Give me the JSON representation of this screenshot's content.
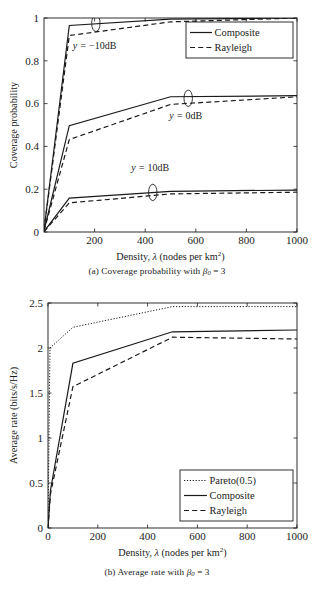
{
  "document": {
    "type": "figure-pair",
    "background_color": "#ffffff",
    "ink_color": "#1a1a1a"
  },
  "figures": [
    {
      "id": "a",
      "caption_prefix": "(a)",
      "caption_text": "Coverage probability with",
      "caption_symbol": "β",
      "caption_subscript": "0",
      "caption_equals": "= 3"
    },
    {
      "id": "b",
      "caption_prefix": "(b)",
      "caption_text": "Average rate with",
      "caption_symbol": "β",
      "caption_subscript": "0",
      "caption_equals": "= 3"
    }
  ],
  "chart_data": [
    {
      "type": "line",
      "id": "coverage-probability",
      "title": "",
      "xlabel": "Density, λ (nodes per km2)",
      "xlabel_parts": {
        "lead": "Density, ",
        "lambda": "λ",
        "rest": " (nodes per km",
        "exponent": "2",
        "close": ")"
      },
      "ylabel": "Coverage probability",
      "xlim": [
        0,
        1000
      ],
      "ylim": [
        0,
        1
      ],
      "xticks": [
        200,
        400,
        600,
        800,
        1000
      ],
      "xtick_labels": [
        "200",
        "400",
        "600",
        "800",
        "1000"
      ],
      "yticks": [
        0,
        0.2,
        0.4,
        0.6,
        0.8,
        1
      ],
      "ytick_labels": [
        "0",
        "0.2",
        "0.4",
        "0.6",
        "0.8",
        "1"
      ],
      "grid": false,
      "legend_position": "top-right",
      "legend": [
        "Composite",
        "Rayleigh"
      ],
      "annotations": [
        {
          "text_lead": "y = ",
          "text_value": "−10dB",
          "x": 200,
          "y": 0.855
        },
        {
          "text_lead": "y = ",
          "text_value": "0dB",
          "x": 560,
          "y": 0.53
        },
        {
          "text_lead": "y = ",
          "text_value": "10dB",
          "x": 420,
          "y": 0.285
        }
      ],
      "marker_ellipses": [
        {
          "x": 205,
          "y": 0.975
        },
        {
          "x": 570,
          "y": 0.625
        },
        {
          "x": 430,
          "y": 0.185
        }
      ],
      "groups": [
        {
          "name": "y = -10dB",
          "series": [
            {
              "name": "Composite",
              "style": "solid",
              "x": [
                0,
                100,
                500,
                1000
              ],
              "values": [
                0.01,
                0.965,
                0.995,
                1.0
              ]
            },
            {
              "name": "Rayleigh",
              "style": "dashed",
              "x": [
                0,
                100,
                500,
                1000
              ],
              "values": [
                0.01,
                0.918,
                0.982,
                1.0
              ]
            }
          ]
        },
        {
          "name": "y = 0dB",
          "series": [
            {
              "name": "Composite",
              "style": "solid",
              "x": [
                0,
                100,
                500,
                1000
              ],
              "values": [
                0.005,
                0.497,
                0.632,
                0.637
              ]
            },
            {
              "name": "Rayleigh",
              "style": "dashed",
              "x": [
                0,
                100,
                500,
                1000
              ],
              "values": [
                0.005,
                0.432,
                0.596,
                0.632
              ]
            }
          ]
        },
        {
          "name": "y = 10dB",
          "series": [
            {
              "name": "Composite",
              "style": "solid",
              "x": [
                0,
                100,
                500,
                1000
              ],
              "values": [
                0.002,
                0.158,
                0.19,
                0.196
              ]
            },
            {
              "name": "Rayleigh",
              "style": "dashed",
              "x": [
                0,
                100,
                500,
                1000
              ],
              "values": [
                0.002,
                0.136,
                0.178,
                0.186
              ]
            }
          ]
        }
      ]
    },
    {
      "type": "line",
      "id": "average-rate",
      "title": "",
      "xlabel": "Density, λ (nodes per km2)",
      "xlabel_parts": {
        "lead": "Density, ",
        "lambda": "λ",
        "rest": " (nodes per km",
        "exponent": "2",
        "close": ")"
      },
      "ylabel": "Average rate (bits/s/Hz)",
      "xlim": [
        0,
        1000
      ],
      "ylim": [
        0,
        2.5
      ],
      "xticks": [
        0,
        200,
        400,
        600,
        800,
        1000
      ],
      "xtick_labels": [
        "0",
        "200",
        "400",
        "600",
        "800",
        "1000"
      ],
      "yticks": [
        0,
        0.5,
        1,
        1.5,
        2,
        2.5
      ],
      "ytick_labels": [
        "0",
        "0.5",
        "1",
        "1.5",
        "2",
        "2.5"
      ],
      "grid": false,
      "legend_position": "bottom-right",
      "legend": [
        "Pareto(0.5)",
        "Composite",
        "Rayleigh"
      ],
      "series": [
        {
          "name": "Pareto(0.5)",
          "style": "dotted",
          "x": [
            0,
            8,
            100,
            500,
            1000
          ],
          "values": [
            0.0,
            2.0,
            2.23,
            2.46,
            2.46
          ]
        },
        {
          "name": "Composite",
          "style": "solid",
          "x": [
            0,
            10,
            100,
            500,
            1000
          ],
          "values": [
            0.0,
            0.42,
            1.83,
            2.18,
            2.2
          ]
        },
        {
          "name": "Rayleigh",
          "style": "dashed",
          "x": [
            0,
            10,
            100,
            500,
            1000
          ],
          "values": [
            0.0,
            0.38,
            1.57,
            2.12,
            2.1
          ]
        }
      ]
    }
  ]
}
